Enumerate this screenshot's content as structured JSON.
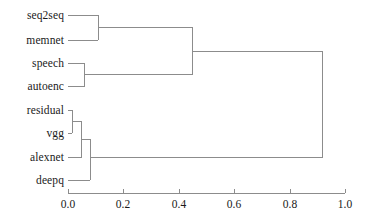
{
  "chart_data": {
    "type": "dendrogram",
    "title": "",
    "xlabel": "",
    "ylabel": "",
    "orientation": "horizontal",
    "xlim": [
      0.0,
      1.0
    ],
    "grid": false,
    "legend": "none",
    "line_color": "#8c8c8c",
    "axis_color": "#8c8c8c",
    "text_color": "#1a1a1a",
    "leaves": [
      {
        "label": "seq2seq",
        "y": 15
      },
      {
        "label": "memnet",
        "y": 40
      },
      {
        "label": "speech",
        "y": 63
      },
      {
        "label": "autoenc",
        "y": 86
      },
      {
        "label": "residual",
        "y": 110
      },
      {
        "label": "vgg",
        "y": 133
      },
      {
        "label": "alexnet",
        "y": 157
      },
      {
        "label": "deepq",
        "y": 180
      }
    ],
    "merges": [
      {
        "name": "residual-vgg",
        "members": [
          "residual",
          "vgg"
        ],
        "distance": 0.015,
        "y": 121.5
      },
      {
        "name": "residual-vgg-alexnet",
        "members": [
          "residual",
          "vgg",
          "alexnet"
        ],
        "distance": 0.05,
        "y": 139.0
      },
      {
        "name": "speech-autoenc",
        "members": [
          "speech",
          "autoenc"
        ],
        "distance": 0.06,
        "y": 74.5
      },
      {
        "name": "cnn-cluster",
        "members": [
          "residual",
          "vgg",
          "alexnet",
          "deepq"
        ],
        "distance": 0.08,
        "y": 157.0
      },
      {
        "name": "seq2seq-memnet",
        "members": [
          "seq2seq",
          "memnet"
        ],
        "distance": 0.11,
        "y": 27.5
      },
      {
        "name": "sequence-cluster",
        "members": [
          "seq2seq",
          "memnet",
          "speech",
          "autoenc"
        ],
        "distance": 0.45,
        "y": 51.0
      },
      {
        "name": "root",
        "members": [
          "seq2seq",
          "memnet",
          "speech",
          "autoenc",
          "residual",
          "vgg",
          "alexnet",
          "deepq"
        ],
        "distance": 0.92,
        "y": 104.0
      }
    ],
    "xticks": [
      {
        "value": 0.0,
        "label": "0.0",
        "px": 68
      },
      {
        "value": 0.2,
        "label": "0.2",
        "px": 123
      },
      {
        "value": 0.4,
        "label": "0.4",
        "px": 179
      },
      {
        "value": 0.6,
        "label": "0.6",
        "px": 234
      },
      {
        "value": 0.8,
        "label": "0.8",
        "px": 290
      },
      {
        "value": 1.0,
        "label": "1.0",
        "px": 345
      }
    ]
  },
  "labels": {
    "seq2seq": "seq2seq",
    "memnet": "memnet",
    "speech": "speech",
    "autoenc": "autoenc",
    "residual": "residual",
    "vgg": "vgg",
    "alexnet": "alexnet",
    "deepq": "deepq"
  },
  "ticks": {
    "t0": "0.0",
    "t1": "0.2",
    "t2": "0.4",
    "t3": "0.6",
    "t4": "0.8",
    "t5": "1.0"
  }
}
